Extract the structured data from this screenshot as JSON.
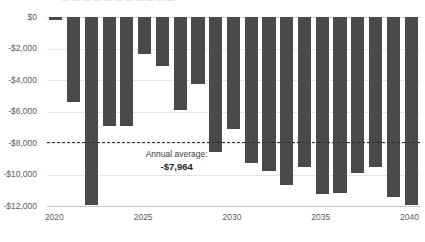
{
  "chart_data": {
    "type": "bar",
    "title": "",
    "xlabel": "",
    "ylabel": "",
    "ylim": [
      -12600,
      0
    ],
    "grid": true,
    "legend": "none",
    "categories": [
      "2020",
      "2021",
      "2022",
      "2023",
      "2024",
      "2025",
      "2026",
      "2027",
      "2028",
      "2029",
      "2030",
      "2031",
      "2032",
      "2033",
      "2034",
      "2035",
      "2036",
      "2037",
      "2038",
      "2039",
      "2040"
    ],
    "values": [
      -180,
      -5400,
      -11950,
      -6900,
      -6900,
      -2350,
      -3100,
      -5900,
      -4250,
      -8550,
      -7100,
      -9300,
      -9750,
      -10650,
      -9500,
      -11250,
      -11150,
      -9900,
      -9500,
      -11450,
      -11950
    ],
    "series": [
      {
        "name": "Annual deficit",
        "values": [
          -180,
          -5400,
          -11950,
          -6900,
          -6900,
          -2350,
          -3100,
          -5900,
          -4250,
          -8550,
          -7100,
          -9300,
          -9750,
          -10650,
          -9500,
          -11250,
          -11150,
          -9900,
          -9500,
          -11450,
          -11950
        ]
      }
    ],
    "y_ticks": [
      0,
      -2000,
      -4000,
      -6000,
      -8000,
      -10000,
      -12000
    ],
    "y_tick_labels": [
      "$0",
      "-$2,000",
      "-$4,000",
      "-$6,000",
      "-$8,000",
      "-$10,000",
      "-$12,000"
    ],
    "x_ticks": [
      "2020",
      "2025",
      "2030",
      "2035",
      "2040"
    ],
    "reference_line": {
      "value": -7964,
      "style": "dashed",
      "label_caption": "Annual average:",
      "label_value": "-$7,964"
    },
    "colors": {
      "bar": "#4a4a4a",
      "grid": "#e6e6e6",
      "axis": "#c9c9c9",
      "reference_line": "#2f2f2f",
      "tick_label": "#5c5c5c",
      "background": "#ffffff"
    }
  },
  "clipped_title": "— — — — — — — — — — —"
}
